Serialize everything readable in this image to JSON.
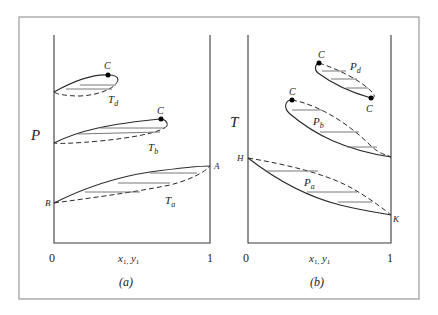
{
  "figure": {
    "panel_a": {
      "y_axis_label": "P",
      "x_axis_label": "x",
      "x_axis_sub1": "1,",
      "x_axis_label2": "y",
      "x_axis_sub2": "1",
      "x_tick_min": "0",
      "x_tick_max": "1",
      "caption": "(a)",
      "curves": {
        "Td": {
          "label": "T",
          "sub": "d",
          "critical_label": "C"
        },
        "Tb": {
          "label": "T",
          "sub": "b",
          "critical_label": "C"
        },
        "Ta": {
          "label": "T",
          "sub": "a",
          "end_left": "B",
          "end_right": "A"
        }
      }
    },
    "panel_b": {
      "y_axis_label": "T",
      "x_axis_label": "x",
      "x_axis_sub1": "1,",
      "x_axis_label2": "y",
      "x_axis_sub2": "1",
      "x_tick_min": "0",
      "x_tick_max": "1",
      "caption": "(b)",
      "curves": {
        "Pd": {
          "label": "P",
          "sub": "d",
          "critical_label_top": "C",
          "critical_label_bottom": "C"
        },
        "Pb": {
          "label": "P",
          "sub": "b",
          "critical_label": "C"
        },
        "Pa": {
          "label": "P",
          "sub": "a",
          "end_left": "H",
          "end_right": "K"
        }
      }
    }
  }
}
